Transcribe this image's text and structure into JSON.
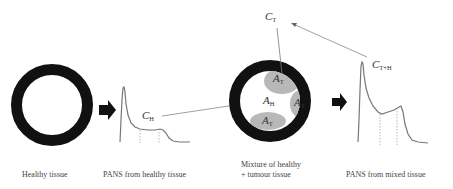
{
  "diagram": {
    "captions": {
      "healthy_tissue": "Healthy tissue",
      "pans_healthy": "PANS from healthy tissue",
      "mixture_line1": "Mixture of healthy",
      "mixture_line2": "+ tumour tissue",
      "pans_mixed": "PANS from mixed tissue"
    },
    "symbols": {
      "C": "C",
      "A": "A",
      "H_sub": "H",
      "T_sub": "T",
      "TH_sub": "T+H"
    },
    "labels": {
      "c_h": {
        "main": "C",
        "sub": "H"
      },
      "c_t": {
        "main": "C",
        "sub": "T"
      },
      "c_th": {
        "main": "C",
        "sub": "T+H"
      },
      "a_h": {
        "main": "A",
        "sub": "H"
      },
      "a_t_top": {
        "main": "A",
        "sub": "T"
      },
      "a_t_right": {
        "main": "A",
        "sub": "T"
      },
      "a_t_bottom": {
        "main": "A",
        "sub": "T"
      }
    },
    "colors": {
      "ring": "#111111",
      "tumour_region": "#b8b8b8",
      "curve": "#777777",
      "arrow": "#111111",
      "connector": "#888888"
    }
  }
}
